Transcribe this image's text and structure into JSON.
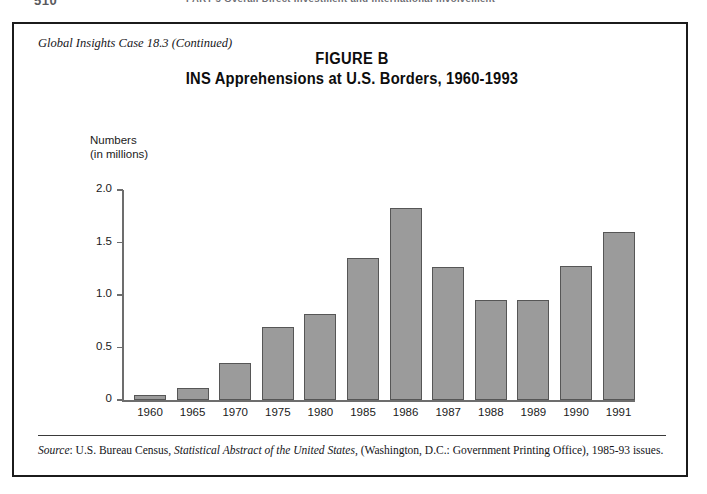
{
  "page": {
    "folio": "510",
    "running_head": "PART 5  Overall Direct Investment and International Involvement"
  },
  "figure": {
    "case_label": "Global Insights Case 18.3 (Continued)",
    "title_line1": "FIGURE B",
    "title_line2": "INS Apprehensions at U.S. Borders, 1960-1993",
    "source_prefix": "Source",
    "source_text_1": ": U.S. Bureau Census, ",
    "source_italic": "Statistical Abstract of the United States",
    "source_text_2": ", (Washington, D.C.: Government Printing Office), 1985-93 issues.",
    "bar_color": "#9b9b9b",
    "bar_edge_color": "#565656",
    "axis_color": "#6d6d6d",
    "frame_color": "#1b1b1b"
  },
  "chart_data": {
    "type": "bar",
    "title": "INS Apprehensions at U.S. Borders, 1960-1993",
    "xlabel": "",
    "ylabel": "Numbers (in millions)",
    "ylabel_line1": "Numbers",
    "ylabel_line2": "(in millions)",
    "categories": [
      "1960",
      "1965",
      "1970",
      "1975",
      "1980",
      "1985",
      "1986",
      "1987",
      "1988",
      "1989",
      "1990",
      "1991"
    ],
    "values": [
      0.05,
      0.11,
      0.35,
      0.7,
      0.82,
      1.35,
      1.83,
      1.27,
      0.95,
      0.95,
      1.28,
      1.6
    ],
    "ylim": [
      0,
      2.0
    ],
    "yticks": [
      2.0,
      1.5,
      1.0,
      0.5,
      0
    ],
    "ytick_labels": [
      "2.0",
      "1.5",
      "1.0",
      "0.5",
      "0"
    ],
    "grid": false,
    "legend": false
  }
}
